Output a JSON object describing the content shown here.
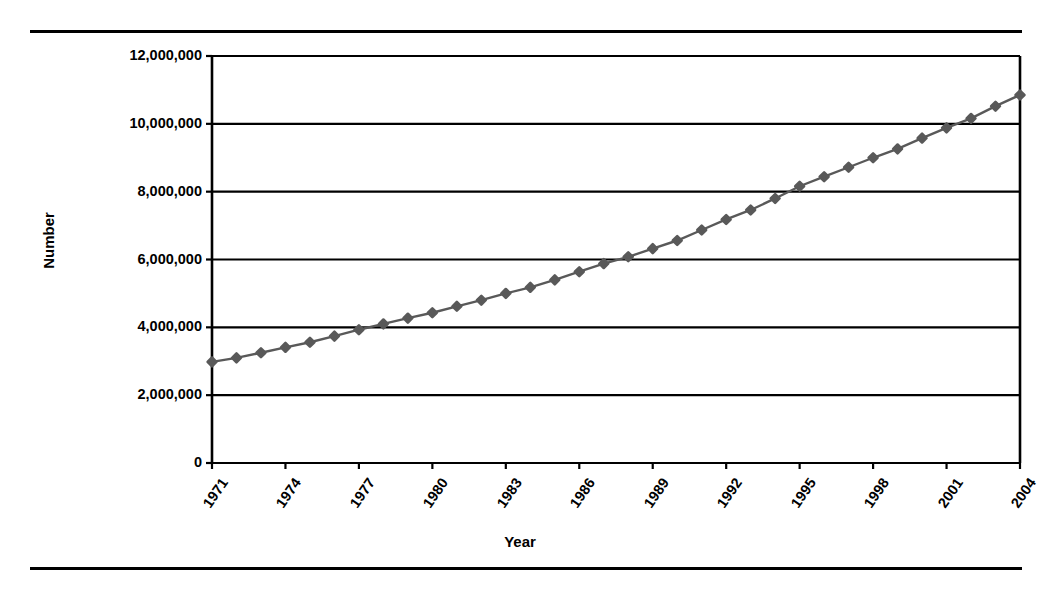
{
  "chart_data": {
    "type": "line",
    "title": "",
    "xlabel": "Year",
    "ylabel": "Number",
    "xlim": [
      1971,
      2004
    ],
    "ylim": [
      0,
      12000000
    ],
    "grid": true,
    "legend": null,
    "x_tick_labels": [
      "1971",
      "1974",
      "1977",
      "1980",
      "1983",
      "1986",
      "1989",
      "1992",
      "1995",
      "1998",
      "2001",
      "2004"
    ],
    "y_tick_labels": [
      "0",
      "2,000,000",
      "4,000,000",
      "6,000,000",
      "8,000,000",
      "10,000,000",
      "12,000,000"
    ],
    "y_tick_values": [
      0,
      2000000,
      4000000,
      6000000,
      8000000,
      10000000,
      12000000
    ],
    "marker": "diamond",
    "series": [
      {
        "name": "Number",
        "color": "#595959",
        "x": [
          1971,
          1972,
          1973,
          1974,
          1975,
          1976,
          1977,
          1978,
          1979,
          1980,
          1981,
          1982,
          1983,
          1984,
          1985,
          1986,
          1987,
          1988,
          1989,
          1990,
          1991,
          1992,
          1993,
          1994,
          1995,
          1996,
          1997,
          1998,
          1999,
          2000,
          2001,
          2002,
          2003,
          2004
        ],
        "values": [
          2980000,
          3100000,
          3250000,
          3410000,
          3560000,
          3740000,
          3930000,
          4100000,
          4270000,
          4430000,
          4620000,
          4800000,
          5000000,
          5180000,
          5400000,
          5640000,
          5880000,
          6080000,
          6320000,
          6560000,
          6870000,
          7180000,
          7460000,
          7800000,
          8160000,
          8440000,
          8720000,
          9000000,
          9260000,
          9580000,
          9880000,
          10160000,
          10520000,
          10850000
        ]
      }
    ]
  },
  "axes": {
    "y_title": "Number",
    "x_title": "Year"
  }
}
